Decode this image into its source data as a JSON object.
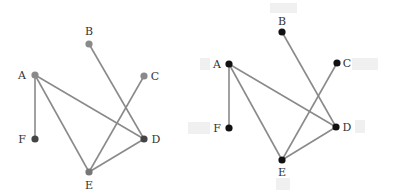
{
  "graphs": [
    {
      "id": "left",
      "edge_color": "#8a8a8a",
      "nodes": [
        {
          "id": "A",
          "label": "A",
          "x": 35,
          "y": 75,
          "lx": 22,
          "ly": 79,
          "color": "#8a8a8a"
        },
        {
          "id": "B",
          "label": "B",
          "x": 89,
          "y": 44,
          "lx": 89,
          "ly": 35,
          "color": "#8a8a8a"
        },
        {
          "id": "C",
          "label": "C",
          "x": 144,
          "y": 76,
          "lx": 155,
          "ly": 80,
          "color": "#8a8a8a"
        },
        {
          "id": "D",
          "label": "D",
          "x": 144,
          "y": 139,
          "lx": 156,
          "ly": 143,
          "color": "#444444"
        },
        {
          "id": "E",
          "label": "E",
          "x": 89,
          "y": 172,
          "lx": 89,
          "ly": 189,
          "color": "#777777"
        },
        {
          "id": "F",
          "label": "F",
          "x": 35,
          "y": 139,
          "lx": 22,
          "ly": 143,
          "color": "#444444"
        }
      ],
      "edges": [
        [
          "A",
          "F"
        ],
        [
          "A",
          "D"
        ],
        [
          "A",
          "E"
        ],
        [
          "B",
          "D"
        ],
        [
          "C",
          "E"
        ],
        [
          "E",
          "D"
        ]
      ]
    },
    {
      "id": "right",
      "edge_color": "#8a8a8a",
      "nodes": [
        {
          "id": "A",
          "label": "A",
          "x": 229,
          "y": 64,
          "lx": 217,
          "ly": 68,
          "color": "#111111"
        },
        {
          "id": "B",
          "label": "B",
          "x": 282,
          "y": 32,
          "lx": 282,
          "ly": 25,
          "color": "#111111"
        },
        {
          "id": "C",
          "label": "C",
          "x": 337,
          "y": 63,
          "lx": 347,
          "ly": 67,
          "color": "#111111"
        },
        {
          "id": "D",
          "label": "D",
          "x": 336,
          "y": 127,
          "lx": 347,
          "ly": 131,
          "color": "#111111"
        },
        {
          "id": "E",
          "label": "E",
          "x": 282,
          "y": 160,
          "lx": 282,
          "ly": 176,
          "color": "#111111"
        },
        {
          "id": "F",
          "label": "F",
          "x": 229,
          "y": 128,
          "lx": 217,
          "ly": 132,
          "color": "#111111"
        }
      ],
      "edges": [
        [
          "A",
          "F"
        ],
        [
          "A",
          "D"
        ],
        [
          "A",
          "E"
        ],
        [
          "B",
          "D"
        ],
        [
          "C",
          "E"
        ],
        [
          "E",
          "D"
        ]
      ]
    }
  ],
  "ghost_boxes": [
    {
      "x": 270,
      "y": 3,
      "w": 27,
      "h": 10
    },
    {
      "x": 352,
      "y": 58,
      "w": 26,
      "h": 12
    },
    {
      "x": 200,
      "y": 58,
      "w": 10,
      "h": 12
    },
    {
      "x": 195,
      "y": 122,
      "w": 15,
      "h": 12
    },
    {
      "x": 355,
      "y": 120,
      "w": 10,
      "h": 13
    },
    {
      "x": 276,
      "y": 178,
      "w": 14,
      "h": 12
    },
    {
      "x": 188,
      "y": 122,
      "w": 8,
      "h": 12
    }
  ]
}
